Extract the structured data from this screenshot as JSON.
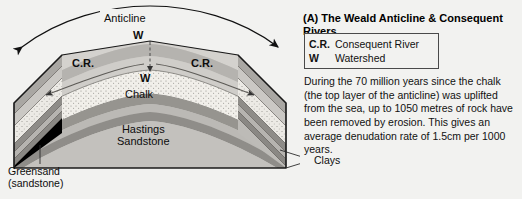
{
  "figure": {
    "background_color": "#f2f2f0",
    "diagram": {
      "labels": {
        "anticline": "Anticline",
        "watershed_crest": "W",
        "watershed_surface": "W",
        "consequent_river_left": "C.R.",
        "consequent_river_right": "C.R.",
        "chalk": "Chalk",
        "hastings_line1": "Hastings",
        "hastings_line2": "Sandstone",
        "greensand_line1": "Greensand",
        "greensand_line2": "(sandstone)",
        "clays": "Clays"
      },
      "strata_colors": {
        "chalk_stipple": "#f0eee9",
        "upper_clay": "#b8b6b2",
        "sandstone_core": "#c9c7c3",
        "dark_band": "#8e8c88",
        "block_face": "#bfbdb9",
        "outline": "#1a1a1a"
      }
    },
    "panel": {
      "title": "(A) The Weald Anticline & Consequent Rivers",
      "legend": [
        {
          "key": "C.R.",
          "value": "Consequent River"
        },
        {
          "key": "W",
          "value": "Watershed"
        }
      ],
      "body": "During the 70 million years since the chalk (the top layer of the anticline) was uplifted from the sea, up to 1050 metres of rock have been removed by erosion. This gives an average denudation rate of 1.5cm per 1000 years."
    }
  }
}
